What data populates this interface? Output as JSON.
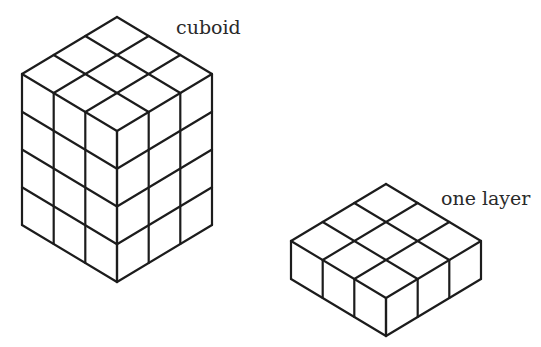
{
  "figure": {
    "line_color": "#1c1c1c",
    "background": "#ffffff"
  },
  "cuboid": {
    "label": "cuboid",
    "columns": 3,
    "rows": 3,
    "layers": 4,
    "apex": [
      117,
      17
    ],
    "unit_right": [
      31.67,
      19
    ],
    "unit_left": [
      -31.67,
      19
    ],
    "layer_height": 37.75
  },
  "layer": {
    "label": "one layer",
    "columns": 3,
    "rows": 3,
    "layers": 1,
    "apex": [
      386,
      184
    ],
    "unit_right": [
      31.67,
      19
    ],
    "unit_left": [
      -31.67,
      19
    ],
    "layer_height": 38
  }
}
